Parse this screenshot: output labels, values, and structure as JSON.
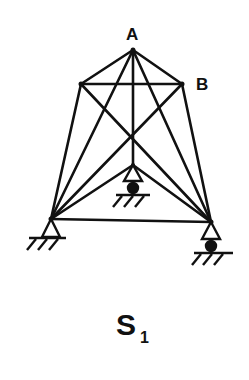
{
  "diagram": {
    "type": "truss-structure",
    "title": "S",
    "title_subscript": "1",
    "labels": {
      "node_a": "A",
      "node_b": "B"
    },
    "nodes": {
      "A": [
        133,
        50
      ],
      "L": [
        81,
        84
      ],
      "B": [
        182,
        84
      ],
      "M": [
        133,
        165
      ],
      "BL": [
        51,
        219
      ],
      "BR": [
        211,
        222
      ]
    },
    "members": [
      [
        "A",
        "L"
      ],
      [
        "A",
        "B"
      ],
      [
        "L",
        "B"
      ],
      [
        "A",
        "BL"
      ],
      [
        "A",
        "BR"
      ],
      [
        "A",
        "M"
      ],
      [
        "L",
        "BL"
      ],
      [
        "B",
        "BR"
      ],
      [
        "L",
        "BR"
      ],
      [
        "B",
        "BL"
      ],
      [
        "M",
        "BL"
      ],
      [
        "M",
        "BR"
      ],
      [
        "BL",
        "BR"
      ]
    ],
    "supports": [
      {
        "node": "BL",
        "type": "pin"
      },
      {
        "node": "M",
        "type": "roller"
      },
      {
        "node": "BR",
        "type": "roller"
      }
    ],
    "line_color": "#111111"
  }
}
